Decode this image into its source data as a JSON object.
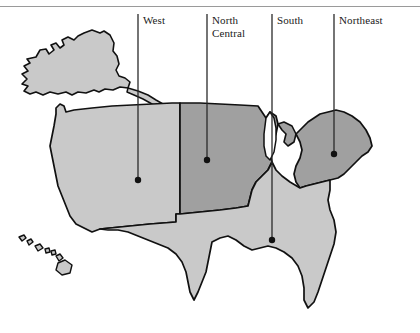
{
  "figure": {
    "background_color": "#ffffff",
    "width": 420,
    "height": 333
  },
  "colors": {
    "region_light": "#c9c9c9",
    "region_dark": "#a0a0a0",
    "outline": "#111111",
    "leader_line": "#2a2a2a",
    "label_text": "#1a1a1a",
    "rule": "#9a9a9a"
  },
  "callouts": [
    {
      "id": "west",
      "label": "West",
      "line_x": 138,
      "line_top": 14,
      "dot_x": 138,
      "dot_y": 180,
      "shade": "light"
    },
    {
      "id": "north-central",
      "label": "North\nCentral",
      "line_x": 207,
      "line_top": 14,
      "dot_x": 207,
      "dot_y": 160,
      "shade": "dark"
    },
    {
      "id": "south",
      "label": "South",
      "line_x": 272,
      "line_top": 14,
      "dot_x": 272,
      "dot_y": 240,
      "shade": "light"
    },
    {
      "id": "northeast",
      "label": "Northeast",
      "line_x": 334,
      "line_top": 14,
      "dot_x": 334,
      "dot_y": 154,
      "shade": "dark"
    }
  ],
  "regions": [
    {
      "id": "west",
      "name": "West",
      "shade": "light"
    },
    {
      "id": "north-central",
      "name": "North Central",
      "shade": "dark"
    },
    {
      "id": "south",
      "name": "South",
      "shade": "light"
    },
    {
      "id": "northeast",
      "name": "Northeast",
      "shade": "dark"
    },
    {
      "id": "alaska",
      "name": "Alaska",
      "shade": "light"
    },
    {
      "id": "hawaii",
      "name": "Hawaii",
      "shade": "light"
    }
  ]
}
